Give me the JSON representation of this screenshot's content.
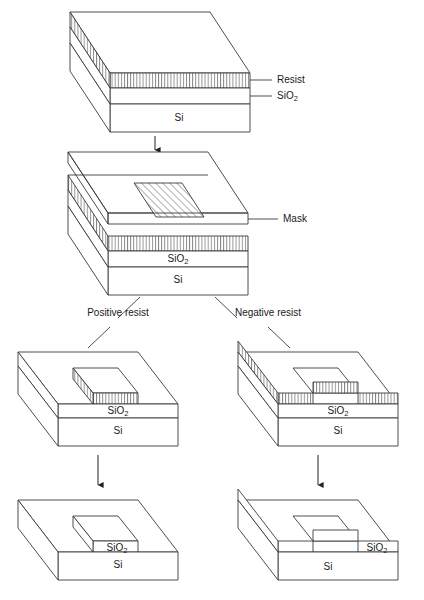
{
  "figure": {
    "background_color": "#ffffff",
    "line_color": "#3a3a3a",
    "text_color": "#1a1a1a"
  },
  "labels": {
    "resist": "Resist",
    "sio2": "SiO",
    "sio2_sub": "2",
    "si": "Si",
    "mask": "Mask",
    "positive_resist": "Positive resist",
    "negative_resist": "Negative resist"
  },
  "stages": [
    {
      "id": "stage-1-coated-wafer",
      "caption_labels": [
        "Resist",
        "SiO2",
        "Si"
      ],
      "description": "Si substrate with SiO2 layer and blanket resist layer on top"
    },
    {
      "id": "stage-2-mask-exposure",
      "caption_labels": [
        "Mask",
        "SiO2",
        "Si"
      ],
      "description": "Mask plate with opaque hatched patch held above the resist-coated wafer during exposure"
    },
    {
      "id": "stage-3-positive-developed",
      "caption_labels": [
        "SiO2",
        "Si"
      ],
      "description": "Positive resist: resist remains only under the opaque mask patch, forming an island"
    },
    {
      "id": "stage-4-negative-developed",
      "caption_labels": [
        "SiO2",
        "Si"
      ],
      "description": "Negative resist: resist removed under the opaque mask patch, forming a window"
    },
    {
      "id": "stage-5-positive-etched",
      "caption_labels": [
        "SiO2",
        "Si"
      ],
      "description": "Positive resist result after etch and strip: SiO2 island remaining on Si"
    },
    {
      "id": "stage-6-negative-etched",
      "caption_labels": [
        "SiO2",
        "Si"
      ],
      "description": "Negative resist result after etch and strip: window etched through SiO2 down to Si"
    }
  ],
  "branches": [
    {
      "label": "Positive resist",
      "side": "left"
    },
    {
      "label": "Negative resist",
      "side": "right"
    }
  ],
  "arrows": [
    {
      "id": "arrow-stage1-to-stage2",
      "direction": "down"
    },
    {
      "id": "arrow-stage3-to-stage5",
      "direction": "down"
    },
    {
      "id": "arrow-stage4-to-stage6",
      "direction": "down"
    }
  ],
  "hatching": {
    "resist_pattern": "vertical-lines",
    "mask_patch_pattern": "diagonal-lines-45"
  }
}
